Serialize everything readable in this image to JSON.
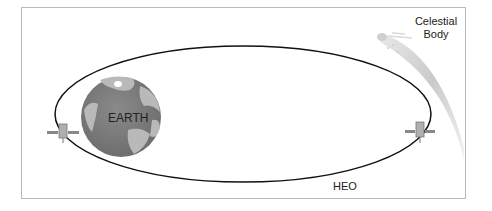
{
  "diagram": {
    "type": "orbit-diagram",
    "labels": {
      "earth": "EARTH",
      "orbit": "HEO",
      "celestial_line1": "Celestial",
      "celestial_line2": "Body"
    },
    "elements": [
      {
        "name": "earth",
        "shape": "globe"
      },
      {
        "name": "orbit",
        "shape": "ellipse",
        "label": "HEO"
      },
      {
        "name": "satellite-perigee",
        "shape": "satellite-icon"
      },
      {
        "name": "satellite-apogee",
        "shape": "satellite-icon"
      },
      {
        "name": "celestial-body",
        "shape": "comet"
      }
    ],
    "colors": {
      "orbit": "#111111",
      "earth_ocean": "#7a7a7a",
      "earth_land": "#b9b9b9",
      "comet_tail": "#bdbdbd",
      "frame": "#b8b8b8"
    }
  }
}
